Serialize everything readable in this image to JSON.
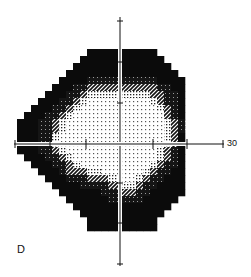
{
  "chart_data": {
    "type": "heatmap",
    "title": "",
    "panel_label": "D",
    "subtype": "visual field grayscale map",
    "xlabel": "",
    "ylabel": "",
    "axis_end_label": "30",
    "x_range_degrees": [
      -30,
      30
    ],
    "y_range_degrees": [
      -30,
      30
    ],
    "grid": false,
    "legend": "none",
    "levels": {
      "0": "white (normal sensitivity)",
      "1": "light dotted",
      "2": "diagonal hatch",
      "3": "dark speckle",
      "4": "black (absolute defect)"
    },
    "cell_size_px": 7,
    "origin_px": [
      17,
      49
    ],
    "center_px": [
      120,
      144
    ],
    "rows": [
      "..........4444..4444......",
      ".........44444..44444.....",
      "........444444..444444....",
      ".......4444444..4444444...",
      "......44443333..33334444..",
      ".....444332222..22223344..",
      "....4443321111..11122334..",
      "...44433210000..00012334..",
      "..444332100000..00001234..",
      ".4443321000000..00000234..",
      "44433210000000..00000123..",
      "44433210000000..00000123..",
      "44433100000000..00000124..",
      "44433100000000..00000124..",
      "44433210000000..00001234..",
      ".4443321000000..00001234..",
      "..444332100000..00012334..",
      "...44432221100..00123344..",
      "....4443332221..01233444..",
      ".....444433332..12334444..",
      "......44444433..23344444..",
      ".......4444443..3344444...",
      "........444444..444444....",
      ".........44444..44444.....",
      "..........4444..4444......",
      "..........4444..4444......"
    ]
  },
  "labels": {
    "panel": "D",
    "axis_end": "30"
  }
}
